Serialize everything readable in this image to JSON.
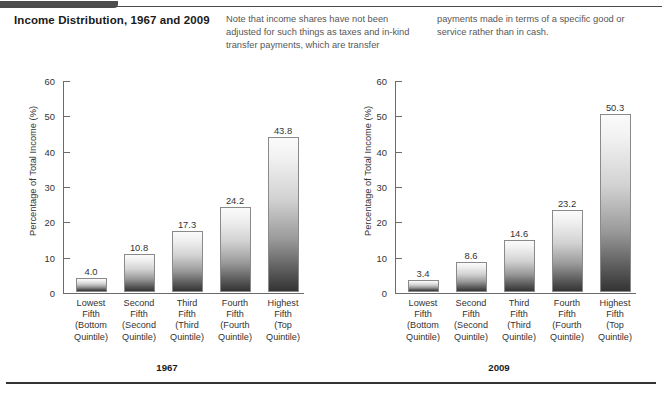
{
  "figure": {
    "title": "Income Distribution, 1967 and 2009",
    "notes": [
      "Note that income shares have not been adjusted for such things as taxes and in-kind transfer payments, which are transfer",
      "payments made in terms of a specific good or service rather than in cash."
    ]
  },
  "chart_data": [
    {
      "type": "bar",
      "title": "1967",
      "xlabel": "",
      "ylabel": "Percentage of Total Income (%)",
      "ylim": [
        0,
        60
      ],
      "yticks": [
        0,
        10,
        20,
        30,
        40,
        50,
        60
      ],
      "grid": false,
      "legend": "none",
      "categories": [
        "Lowest Fifth (Bottom Quintile)",
        "Second Fifth (Second Quintile)",
        "Third Fifth (Third Quintile)",
        "Fourth Fifth (Fourth Quintile)",
        "Highest Fifth (Top Quintile)"
      ],
      "category_lines": [
        [
          "Lowest",
          "Fifth",
          "(Bottom",
          "Quintile)"
        ],
        [
          "Second",
          "Fifth",
          "(Second",
          "Quintile)"
        ],
        [
          "Third",
          "Fifth",
          "(Third",
          "Quintile)"
        ],
        [
          "Fourth",
          "Fifth",
          "(Fourth",
          "Quintile)"
        ],
        [
          "Highest",
          "Fifth",
          "(Top",
          "Quintile)"
        ]
      ],
      "values": [
        4.0,
        10.8,
        17.3,
        24.2,
        43.8
      ],
      "value_labels": [
        "4.0",
        "10.8",
        "17.3",
        "24.2",
        "43.8"
      ]
    },
    {
      "type": "bar",
      "title": "2009",
      "xlabel": "",
      "ylabel": "Percentage of Total Income (%)",
      "ylim": [
        0,
        60
      ],
      "yticks": [
        0,
        10,
        20,
        30,
        40,
        50,
        60
      ],
      "grid": false,
      "legend": "none",
      "categories": [
        "Lowest Fifth (Bottom Quintile)",
        "Second Fifth (Second Quintile)",
        "Third Fifth (Third Quintile)",
        "Fourth Fifth (Fourth Quintile)",
        "Highest Fifth (Top Quintile)"
      ],
      "category_lines": [
        [
          "Lowest",
          "Fifth",
          "(Bottom",
          "Quintile)"
        ],
        [
          "Second",
          "Fifth",
          "(Second",
          "Quintile)"
        ],
        [
          "Third",
          "Fifth",
          "(Third",
          "Quintile)"
        ],
        [
          "Fourth",
          "Fifth",
          "(Fourth",
          "Quintile)"
        ],
        [
          "Highest",
          "Fifth",
          "(Top",
          "Quintile)"
        ]
      ],
      "values": [
        3.4,
        8.6,
        14.6,
        23.2,
        50.3
      ],
      "value_labels": [
        "3.4",
        "8.6",
        "14.6",
        "23.2",
        "50.3"
      ]
    }
  ],
  "style": {
    "axis_color": "#6b6b6b",
    "text_color": "#333333",
    "rule_color": "#333333",
    "bar_top_color": "#fbfbfb",
    "bar_bottom_color": "#343434"
  }
}
